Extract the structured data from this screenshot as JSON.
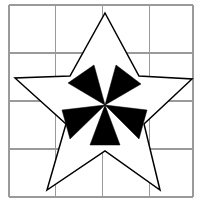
{
  "figure": {
    "background_color": "#ffffff",
    "canvas": {
      "width": 200,
      "height": 204
    },
    "grid": {
      "name": "four-by-four-grid",
      "columns": 4,
      "rows": 4,
      "stroke_color": "#9a9a9a",
      "stroke_width": 1.1,
      "x_positions": [
        9,
        55.75,
        102.5,
        149.25,
        193
      ],
      "y_positions": [
        5,
        53,
        101,
        149,
        197
      ]
    },
    "star": {
      "name": "five-pointed-star-outline",
      "fill_color": "#ffffff",
      "stroke_color": "#000000",
      "stroke_width": 1.5,
      "points": 5,
      "outer_vertices": [
        {
          "label": "top",
          "x": 105,
          "y": 13
        },
        {
          "label": "right",
          "x": 192,
          "y": 79
        },
        {
          "label": "bottom-right",
          "x": 160,
          "y": 190
        },
        {
          "label": "bottom-left",
          "x": 47,
          "y": 190
        },
        {
          "label": "left",
          "x": 15,
          "y": 78
        }
      ],
      "inner_vertices": [
        {
          "label": "upper-right",
          "x": 139,
          "y": 76
        },
        {
          "label": "lower-right",
          "x": 144,
          "y": 124
        },
        {
          "label": "bottom",
          "x": 105,
          "y": 151
        },
        {
          "label": "lower-left",
          "x": 66,
          "y": 124
        },
        {
          "label": "upper-left",
          "x": 70,
          "y": 76
        }
      ]
    },
    "pinwheel": {
      "name": "five-blade-pinwheel",
      "fill_color": "#000000",
      "blades": 5,
      "center": {
        "x": 105,
        "y": 105
      },
      "blade_list": [
        {
          "label": "upper-left-blade",
          "vertices": [
            {
              "x": 105,
              "y": 105
            },
            {
              "x": 68,
              "y": 83
            },
            {
              "x": 94,
              "y": 65
            }
          ]
        },
        {
          "label": "upper-right-blade",
          "vertices": [
            {
              "x": 105,
              "y": 105
            },
            {
              "x": 116,
              "y": 65
            },
            {
              "x": 141,
              "y": 84
            }
          ]
        },
        {
          "label": "right-blade",
          "vertices": [
            {
              "x": 105,
              "y": 105
            },
            {
              "x": 147,
              "y": 110
            },
            {
              "x": 139,
              "y": 139
            }
          ]
        },
        {
          "label": "bottom-blade",
          "vertices": [
            {
              "x": 105,
              "y": 105
            },
            {
              "x": 120,
              "y": 145
            },
            {
              "x": 90,
              "y": 145
            }
          ]
        },
        {
          "label": "left-blade",
          "vertices": [
            {
              "x": 105,
              "y": 105
            },
            {
              "x": 70,
              "y": 139
            },
            {
              "x": 62,
              "y": 110
            }
          ]
        }
      ]
    }
  }
}
